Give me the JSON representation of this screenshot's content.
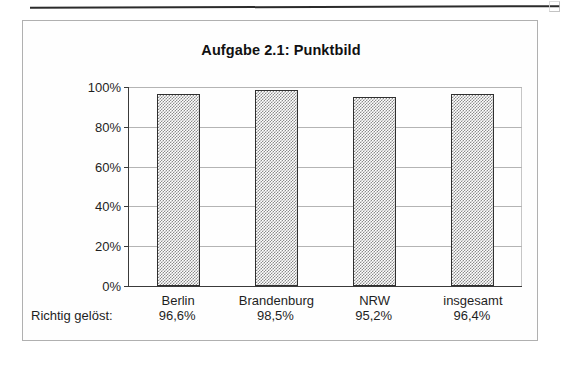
{
  "page": {
    "top_rule": "horizontal-rule",
    "corner_mark": "scan-corner-artifact"
  },
  "chart_data": {
    "type": "bar",
    "title": "Aufgabe 2.1: Punktbild",
    "categories": [
      "Berlin",
      "Brandenburg",
      "NRW",
      "insgesamt"
    ],
    "values": [
      96.6,
      98.5,
      95.2,
      96.4
    ],
    "value_labels": [
      "96,6%",
      "98,5%",
      "95,2%",
      "96,4%"
    ],
    "series": [
      {
        "name": "Richtig gelöst",
        "values": [
          96.6,
          98.5,
          95.2,
          96.4
        ]
      }
    ],
    "xlabel": "",
    "ylabel": "",
    "ylim": [
      0,
      100
    ],
    "yticks": [
      0,
      20,
      40,
      60,
      80,
      100
    ],
    "ytick_labels": [
      "0%",
      "20%",
      "40%",
      "60%",
      "80%",
      "100%"
    ],
    "grid": true,
    "legend": false,
    "bar_fill": "checkerboard-hatch",
    "bar_fill_color": "#8b8b8b",
    "bar_border_color": "#303030",
    "gridline_color": "#b4b4b4",
    "axis_color": "#3a3a3a"
  },
  "annotation": {
    "label": "Richtig gelöst:",
    "values": [
      "96,6%",
      "98,5%",
      "95,2%",
      "96,4%"
    ]
  }
}
